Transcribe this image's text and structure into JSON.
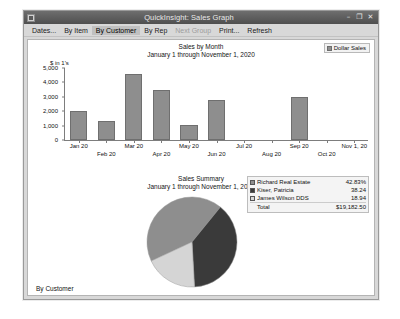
{
  "window": {
    "title": "QuickInsight: Sales Graph",
    "icon": "app-icon",
    "minimize_label": "–",
    "maximize_label": "❐",
    "close_label": "✕"
  },
  "menu": {
    "items": [
      {
        "label": "Dates...",
        "state": "normal"
      },
      {
        "label": "By Item",
        "state": "normal"
      },
      {
        "label": "By Customer",
        "state": "selected"
      },
      {
        "label": "By Rep",
        "state": "normal"
      },
      {
        "label": "Next Group",
        "state": "disabled"
      },
      {
        "label": "Print...",
        "state": "normal"
      },
      {
        "label": "Refresh",
        "state": "normal"
      }
    ]
  },
  "status": {
    "bottom_label": "By Customer"
  },
  "chart_data": [
    {
      "type": "bar",
      "title": "Sales by Month",
      "subtitle": "January 1 through November 1, 2020",
      "ylabel": "$ in 1's",
      "xlabel": "",
      "legend": [
        {
          "name": "Dollar Sales",
          "color": "#8e8e8e"
        }
      ],
      "legend_position": "top-right",
      "grid": false,
      "ylim": [
        0,
        5000
      ],
      "yticks": [
        {
          "label": "5,000",
          "value": 5000
        },
        {
          "label": "4,000",
          "value": 4000
        },
        {
          "label": "3,000",
          "value": 3000
        },
        {
          "label": "2,000",
          "value": 2000
        },
        {
          "label": "1,000",
          "value": 1000
        },
        {
          "label": "0",
          "value": 0
        }
      ],
      "categories": [
        "Jan 20",
        "Feb 20",
        "Mar 20",
        "Apr 20",
        "May 20",
        "Jun 20",
        "Jul 20",
        "Aug 20",
        "Sep 20",
        "Oct 20",
        "Nov 1, 20"
      ],
      "values": [
        2000,
        1300,
        4600,
        3500,
        1050,
        2800,
        0,
        0,
        3000,
        0,
        0
      ]
    },
    {
      "type": "pie",
      "title": "Sales Summary",
      "subtitle": "January 1 through November 1, 2020",
      "legend_position": "top-right",
      "slices": [
        {
          "label": "Richard Real Estate",
          "value": "42.83%",
          "percent": 42.83,
          "color": "#8e8e8e"
        },
        {
          "label": "Kiser, Patricia",
          "value": "38.24",
          "percent": 38.24,
          "color": "#3a3a3a"
        },
        {
          "label": "James Wilson DDS",
          "value": "18.94",
          "percent": 18.94,
          "color": "#d5d5d5"
        }
      ],
      "total": {
        "label": "Total",
        "value": "$19,182.50"
      }
    }
  ]
}
